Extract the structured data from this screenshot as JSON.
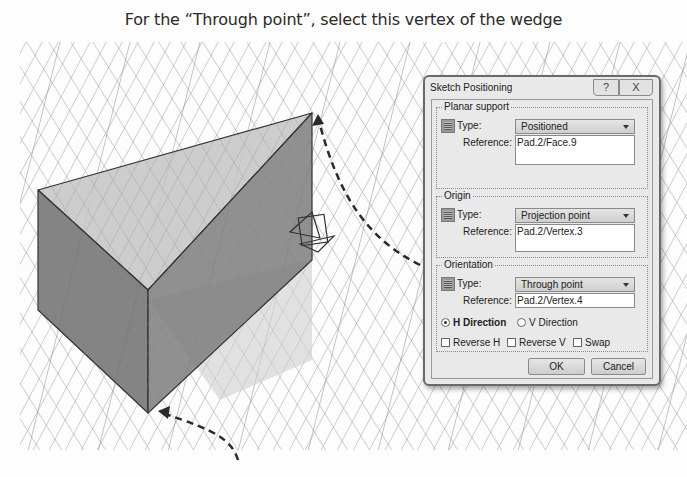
{
  "caption": "For the “Through point”, select this vertex of the wedge",
  "viewport": {
    "grid_color": "#8a8a8a",
    "wedge_top_face_color": "#bdbdbd",
    "wedge_side_face_color": "#7a7a7a",
    "arrow_color": "#333333",
    "annotations": [
      "arrow-to-top-right-vertex",
      "arrow-to-bottom-vertex"
    ]
  },
  "dialog": {
    "title": "Sketch Positioning",
    "help_label": "?",
    "close_label": "X",
    "planar_support": {
      "label": "Planar support",
      "type_label": "Type:",
      "type_value": "Positioned",
      "reference_label": "Reference:",
      "reference_value": "Pad.2/Face.9"
    },
    "origin": {
      "label": "Origin",
      "type_label": "Type:",
      "type_value": "Projection point",
      "reference_label": "Reference:",
      "reference_value": "Pad.2/Vertex.3"
    },
    "orientation": {
      "label": "Orientation",
      "type_label": "Type:",
      "type_value": "Through point",
      "reference_label": "Reference:",
      "reference_value": "Pad.2/Vertex.4",
      "h_direction_label": "H Direction",
      "v_direction_label": "V Direction",
      "selected_direction": "H Direction"
    },
    "options": {
      "reverse_h_label": "Reverse H",
      "reverse_v_label": "Reverse V",
      "swap_label": "Swap"
    },
    "ok_label": "OK",
    "cancel_label": "Cancel"
  }
}
